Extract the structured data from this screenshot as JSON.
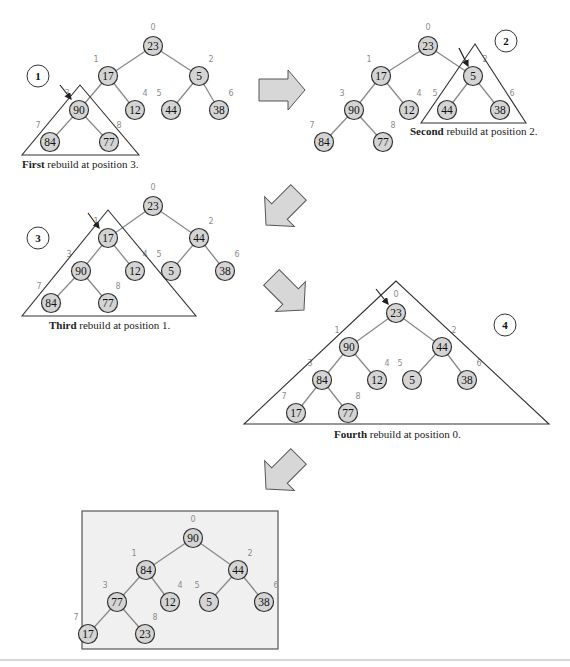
{
  "diagram": {
    "type": "heap-build-steps",
    "frames": [
      {
        "id": "step1",
        "step_number": "1",
        "caption_bold": "First",
        "caption_rest": " rebuild at position 3.",
        "rebuild_position": 3,
        "values": [
          "23",
          "17",
          "5",
          "90",
          "12",
          "44",
          "38",
          "84",
          "77"
        ]
      },
      {
        "id": "step2",
        "step_number": "2",
        "caption_bold": "Second",
        "caption_rest": " rebuild at position 2.",
        "rebuild_position": 2,
        "values": [
          "23",
          "17",
          "5",
          "90",
          "12",
          "44",
          "38",
          "84",
          "77"
        ]
      },
      {
        "id": "step3",
        "step_number": "3",
        "caption_bold": "Third",
        "caption_rest": " rebuild at position 1.",
        "rebuild_position": 1,
        "values": [
          "23",
          "17",
          "44",
          "90",
          "12",
          "5",
          "38",
          "84",
          "77"
        ]
      },
      {
        "id": "step4",
        "step_number": "4",
        "caption_bold": "Fourth",
        "caption_rest": " rebuild at position 0.",
        "rebuild_position": 0,
        "values": [
          "23",
          "90",
          "44",
          "84",
          "12",
          "5",
          "38",
          "17",
          "77"
        ]
      },
      {
        "id": "final",
        "step_number": "",
        "caption_bold": "",
        "caption_rest": "",
        "values": [
          "90",
          "84",
          "44",
          "77",
          "12",
          "5",
          "38",
          "17",
          "23"
        ]
      }
    ],
    "index_labels": [
      "0",
      "1",
      "2",
      "3",
      "4",
      "5",
      "6",
      "7",
      "8"
    ],
    "edges": [
      [
        0,
        1
      ],
      [
        0,
        2
      ],
      [
        1,
        3
      ],
      [
        1,
        4
      ],
      [
        2,
        5
      ],
      [
        2,
        6
      ],
      [
        3,
        7
      ],
      [
        3,
        8
      ]
    ],
    "colors": {
      "node_fill": "#d4d4d4",
      "node_stroke": "#333333",
      "edge": "#8a8a8a",
      "index_label": "#8c8c8c",
      "arrow_fill": "#d7d7d7",
      "final_box_fill": "#f0f0f0"
    }
  }
}
